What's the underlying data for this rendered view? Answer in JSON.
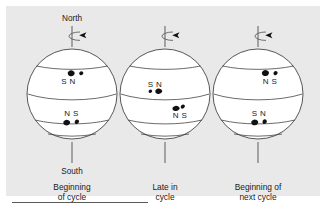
{
  "figure": {
    "domain_kind": "diagram",
    "background_color": "#e9e9e9",
    "ink_color": "#1a1a1a",
    "sphere_fill": "#ffffff",
    "spot_color": "#111111",
    "pole_labels": {
      "north": "North",
      "south": "South"
    },
    "rule_present": true
  },
  "panels": [
    {
      "id": "beginning-of-cycle",
      "caption_lines": [
        "Beginning",
        "of cycle"
      ],
      "rotation_icon": "rotation-arrow-icon",
      "show_pole_labels": true,
      "spot_groups": [
        {
          "hemisphere": "north",
          "label": "S N",
          "label_position": "below",
          "spot_count": 2
        },
        {
          "hemisphere": "south",
          "label": "N S",
          "label_position": "above",
          "spot_count": 2
        }
      ]
    },
    {
      "id": "late-in-cycle",
      "caption_lines": [
        "Late in",
        "cycle"
      ],
      "rotation_icon": "rotation-arrow-icon",
      "show_pole_labels": false,
      "spot_groups": [
        {
          "hemisphere": "north",
          "label": "S N",
          "label_position": "above",
          "spot_count": 2
        },
        {
          "hemisphere": "south",
          "label": "N S",
          "label_position": "below",
          "spot_count": 2
        }
      ]
    },
    {
      "id": "beginning-of-next-cycle",
      "caption_lines": [
        "Beginning of",
        "next cycle"
      ],
      "rotation_icon": "rotation-arrow-icon",
      "show_pole_labels": false,
      "spot_groups": [
        {
          "hemisphere": "north",
          "label": "N S",
          "label_position": "below",
          "spot_count": 2
        },
        {
          "hemisphere": "south",
          "label": "S N",
          "label_position": "above",
          "spot_count": 2
        }
      ]
    }
  ]
}
